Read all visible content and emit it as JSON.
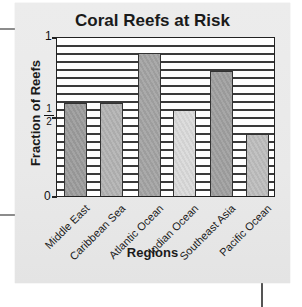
{
  "chart_data": {
    "type": "bar",
    "title": "Coral Reefs at Risk",
    "xlabel": "Regions",
    "ylabel": "Fraction of Reefs",
    "categories": [
      "Middle East",
      "Caribbean Sea",
      "Atlantic Ocean",
      "Indian Ocean",
      "Southeast Asia",
      "Pacific Ocean"
    ],
    "values": [
      0.59,
      0.59,
      0.9,
      0.54,
      0.79,
      0.39
    ],
    "ylim": [
      0,
      1
    ],
    "yticks": [
      {
        "value": 0,
        "label": "0"
      },
      {
        "value": 0.5,
        "label": "1/2"
      },
      {
        "value": 1,
        "label": "1"
      }
    ],
    "grid": true,
    "grid_divisions": 20,
    "legend": null,
    "bar_colors": [
      "#9c9c9c",
      "#b3b3b3",
      "#a3a3a3",
      "#dadada",
      "#a0a0a0",
      "#bdbdbd"
    ]
  },
  "labels": {
    "title": "Coral Reefs at Risk",
    "ylabel": "Fraction of Reefs",
    "xlabel": "Regions",
    "ytick_0": "0",
    "ytick_1": "1",
    "ytick_half_num": "1",
    "ytick_half_den": "2",
    "categories": [
      "Middle East",
      "Caribbean Sea",
      "Atlantic Ocean",
      "Indian Ocean",
      "Southeast Asia",
      "Pacific Ocean"
    ]
  }
}
